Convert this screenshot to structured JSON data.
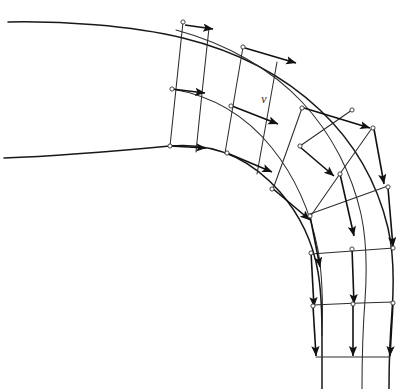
{
  "figure": {
    "type": "vector-field-diagram",
    "canvas": {
      "width": 406,
      "height": 389,
      "background": "#ffffff"
    },
    "labels": [
      {
        "name": "velocity-symbol",
        "text": "v",
        "x": 264,
        "y": 103,
        "style": "italic"
      }
    ],
    "colors": {
      "wall": "#181818",
      "grid": "#2c2c2c",
      "vector": "#111111",
      "node_fill": "#ffffff",
      "background": "#ffffff"
    },
    "walls": [
      {
        "name": "outer-wall",
        "d": "M 8 22 C 60 21 130 25 183 38 C 236 51 284 76 320 110 C 356 144 378 186 388 228 C 394 254 394 284 392 312 C 390 336 389 360 389 389"
      },
      {
        "name": "inner-wall",
        "d": "M 4 158 C 60 156 128 150 170 146 C 215 142 252 160 280 192 C 300 215 313 243 318 272 C 322 296 322 322 322 350 C 322 368 322 378 322 389"
      }
    ],
    "streamlines": [
      {
        "name": "mid-streamline-1",
        "d": "M 176 30 C 228 44 272 70 302 102 C 332 134 352 174 361 214 C 367 242 367 272 365 300 C 363 326 362 352 362 389"
      },
      {
        "name": "mid-streamline-2",
        "d": "M 172 89 C 214 96 248 118 272 148 C 296 178 311 214 318 250 C 323 278 323 308 322 336"
      }
    ],
    "radials": [
      {
        "name": "radial-0",
        "x1": 183,
        "y1": 22,
        "x2": 170,
        "y2": 146,
        "mx": 176,
        "my": 89
      },
      {
        "name": "radial-1",
        "x1": 209,
        "y1": 28,
        "x2": 196,
        "y2": 152,
        "mx": 202,
        "my": 92
      },
      {
        "name": "radial-2",
        "x1": 243,
        "y1": 47,
        "x2": 225,
        "y2": 153,
        "mx": 234,
        "my": 100
      },
      {
        "name": "radial-3",
        "x1": 277,
        "y1": 62,
        "x2": 257,
        "y2": 174,
        "mx": 267,
        "my": 118
      },
      {
        "name": "radial-4",
        "x1": 302,
        "y1": 108,
        "x2": 273,
        "y2": 189,
        "mx": 288,
        "my": 148
      },
      {
        "name": "radial-5",
        "x1": 352,
        "y1": 110,
        "x2": 300,
        "y2": 146,
        "mx": 326,
        "my": 128
      },
      {
        "name": "radial-6",
        "x1": 372,
        "y1": 128,
        "x2": 310,
        "y2": 217,
        "mx": 341,
        "my": 172
      },
      {
        "name": "radial-7",
        "x1": 388,
        "y1": 186,
        "x2": 310,
        "y2": 214,
        "mx": 349,
        "my": 200
      },
      {
        "name": "radial-8",
        "x1": 394,
        "y1": 248,
        "x2": 311,
        "y2": 254,
        "mx": 352,
        "my": 251
      },
      {
        "name": "radial-9",
        "x1": 393,
        "y1": 302,
        "x2": 313,
        "y2": 305,
        "mx": 353,
        "my": 303
      },
      {
        "name": "radial-10",
        "x1": 390,
        "y1": 357,
        "x2": 316,
        "y2": 357,
        "mx": 353,
        "my": 357
      }
    ],
    "vectors": [
      {
        "name": "velocity-vector-1",
        "x1": 185,
        "y1": 25,
        "x2": 213,
        "y2": 29
      },
      {
        "name": "velocity-vector-2",
        "x1": 172,
        "y1": 89,
        "x2": 205,
        "y2": 93
      },
      {
        "name": "velocity-vector-3",
        "x1": 170,
        "y1": 146,
        "x2": 206,
        "y2": 148
      },
      {
        "name": "velocity-vector-4",
        "x1": 245,
        "y1": 48,
        "x2": 296,
        "y2": 63
      },
      {
        "name": "velocity-vector-5",
        "x1": 232,
        "y1": 106,
        "x2": 278,
        "y2": 124
      },
      {
        "name": "velocity-vector-6",
        "x1": 227,
        "y1": 153,
        "x2": 272,
        "y2": 172
      },
      {
        "name": "velocity-vector-7",
        "x1": 304,
        "y1": 108,
        "x2": 370,
        "y2": 128
      },
      {
        "name": "velocity-vector-8",
        "x1": 300,
        "y1": 147,
        "x2": 334,
        "y2": 176
      },
      {
        "name": "velocity-vector-9",
        "x1": 272,
        "y1": 188,
        "x2": 310,
        "y2": 220
      },
      {
        "name": "velocity-vector-10",
        "x1": 374,
        "y1": 129,
        "x2": 384,
        "y2": 184
      },
      {
        "name": "velocity-vector-11",
        "x1": 340,
        "y1": 174,
        "x2": 354,
        "y2": 236
      },
      {
        "name": "velocity-vector-12",
        "x1": 310,
        "y1": 216,
        "x2": 320,
        "y2": 267
      },
      {
        "name": "velocity-vector-13",
        "x1": 388,
        "y1": 188,
        "x2": 393,
        "y2": 247
      },
      {
        "name": "velocity-vector-14",
        "x1": 352,
        "y1": 248,
        "x2": 354,
        "y2": 304
      },
      {
        "name": "velocity-vector-15",
        "x1": 311,
        "y1": 252,
        "x2": 314,
        "y2": 307
      },
      {
        "name": "velocity-vector-16",
        "x1": 393,
        "y1": 303,
        "x2": 390,
        "y2": 356
      },
      {
        "name": "velocity-vector-17",
        "x1": 353,
        "y1": 304,
        "x2": 353,
        "y2": 356
      },
      {
        "name": "velocity-vector-18",
        "x1": 313,
        "y1": 306,
        "x2": 316,
        "y2": 356
      }
    ],
    "nodes": [
      {
        "name": "node-outer-0",
        "x": 183,
        "y": 22
      },
      {
        "name": "node-mid-0",
        "x": 172,
        "y": 89
      },
      {
        "name": "node-inner-0",
        "x": 170,
        "y": 146
      },
      {
        "name": "node-outer-2",
        "x": 243,
        "y": 47
      },
      {
        "name": "node-mid-2",
        "x": 231,
        "y": 106
      },
      {
        "name": "node-inner-2",
        "x": 227,
        "y": 153
      },
      {
        "name": "node-outer-4",
        "x": 302,
        "y": 108
      },
      {
        "name": "node-mid-4",
        "x": 300,
        "y": 146
      },
      {
        "name": "node-inner-4",
        "x": 272,
        "y": 189
      },
      {
        "name": "node-outer-5",
        "x": 352,
        "y": 110
      },
      {
        "name": "node-outer-6",
        "x": 373,
        "y": 128
      },
      {
        "name": "node-mid-6",
        "x": 340,
        "y": 174
      },
      {
        "name": "node-inner-6",
        "x": 310,
        "y": 216
      },
      {
        "name": "node-outer-7",
        "x": 388,
        "y": 187
      },
      {
        "name": "node-outer-8",
        "x": 393,
        "y": 248
      },
      {
        "name": "node-mid-8",
        "x": 352,
        "y": 249
      },
      {
        "name": "node-inner-8",
        "x": 311,
        "y": 253
      },
      {
        "name": "node-outer-9",
        "x": 393,
        "y": 303
      },
      {
        "name": "node-mid-9",
        "x": 353,
        "y": 304
      },
      {
        "name": "node-inner-9",
        "x": 313,
        "y": 306
      }
    ]
  }
}
